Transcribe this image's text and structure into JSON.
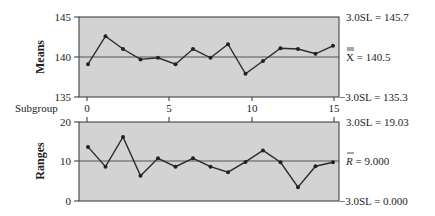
{
  "chart_data": [
    {
      "type": "line",
      "title": "",
      "ylabel": "Means",
      "xlabel": "Subgroup",
      "ylim": [
        135,
        145
      ],
      "y_ticks": [
        135,
        140,
        145
      ],
      "x_ticks": [
        0,
        5,
        10,
        15
      ],
      "grid": false,
      "x": [
        0.5,
        1.5,
        2.5,
        3.5,
        4.5,
        5.5,
        6.5,
        7.5,
        8.5,
        9.5,
        10.5,
        11.5,
        12.5,
        13.5,
        14.5
      ],
      "series": [
        {
          "name": "Means",
          "values": [
            139.1,
            142.6,
            141.0,
            139.7,
            139.9,
            139.1,
            141.0,
            139.9,
            141.6,
            137.9,
            139.5,
            141.1,
            141.0,
            140.4,
            141.4
          ]
        }
      ],
      "center_line": {
        "label": "X̿ = 140.5",
        "value": 140.5
      },
      "ucl": {
        "label": "3.0SL = 145.7",
        "value": 145.7
      },
      "lcl": {
        "label": "−3.0SL = 135.3",
        "value": 135.3
      }
    },
    {
      "type": "line",
      "title": "",
      "ylabel": "Ranges",
      "xlabel": "",
      "ylim": [
        0,
        20
      ],
      "y_ticks": [
        0,
        10,
        20
      ],
      "x_ticks": [
        0,
        5,
        10,
        15
      ],
      "grid": false,
      "x": [
        0.5,
        1.5,
        2.5,
        3.5,
        4.5,
        5.5,
        6.5,
        7.5,
        8.5,
        9.5,
        10.5,
        11.5,
        12.5,
        13.5,
        14.5
      ],
      "series": [
        {
          "name": "Ranges",
          "values": [
            13.7,
            8.7,
            16.2,
            6.4,
            10.8,
            8.7,
            10.8,
            8.7,
            7.3,
            9.9,
            12.8,
            9.8,
            3.5,
            8.8,
            9.8
          ]
        }
      ],
      "center_line": {
        "label": "R̄ = 9.000",
        "value": 9.0
      },
      "ucl": {
        "label": "3.0SL = 19.03",
        "value": 19.03
      },
      "lcl": {
        "label": "−3.0SL = 0.000",
        "value": 0.0
      }
    }
  ],
  "labels": {
    "means_axis": "Means",
    "ranges_axis": "Ranges",
    "subgroup": "Subgroup",
    "means_ticks": [
      "145",
      "140",
      "135"
    ],
    "ranges_ticks": [
      "20",
      "10",
      "0"
    ],
    "x_ticks": [
      "0",
      "5",
      "10",
      "15"
    ],
    "means_ucl": "3.0SL = 145.7",
    "means_center_sym": "X",
    "means_center_val": " = 140.5",
    "means_lcl": "−3.0SL = 135.3",
    "ranges_ucl": "3.0SL = 19.03",
    "ranges_center_sym": "R",
    "ranges_center_val": " = 9.000",
    "ranges_lcl": "−3.0SL = 0.000"
  },
  "colors": {
    "plot_bg": "#d3d3d3",
    "line": "#2a2a2a",
    "center_line": "#555555",
    "axis": "#333333"
  }
}
